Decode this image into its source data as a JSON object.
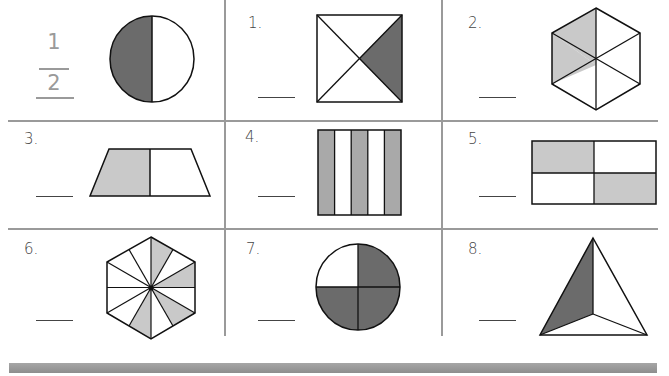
{
  "worksheet": {
    "topic": "Fractions - shaded parts of shapes",
    "example": {
      "numerator": "1",
      "denominator": "2",
      "shape": "circle",
      "parts": 2,
      "shaded": 1
    },
    "problems": [
      {
        "label": "1.",
        "shape": "square-diagonals",
        "parts": 4,
        "shaded": 1,
        "answer": ""
      },
      {
        "label": "2.",
        "shape": "hexagon",
        "parts": 6,
        "shaded": 2,
        "answer": ""
      },
      {
        "label": "3.",
        "shape": "trapezoid",
        "parts": 2,
        "shaded": 1,
        "answer": ""
      },
      {
        "label": "4.",
        "shape": "rectangle-stripes",
        "parts": 5,
        "shaded": 3,
        "answer": ""
      },
      {
        "label": "5.",
        "shape": "rectangle-grid",
        "parts": 4,
        "shaded": 2,
        "answer": ""
      },
      {
        "label": "6.",
        "shape": "hexagon-12",
        "parts": 12,
        "shaded": 4,
        "answer": ""
      },
      {
        "label": "7.",
        "shape": "circle-quarters",
        "parts": 4,
        "shaded": 3,
        "answer": ""
      },
      {
        "label": "8.",
        "shape": "triangle-thirds",
        "parts": 3,
        "shaded": 1,
        "answer": ""
      }
    ],
    "colors": {
      "dark_fill": "#6b6b6b",
      "light_fill": "#c9c9c9",
      "grid_line": "#9a9a9a",
      "example_text": "#9a9a9a"
    }
  }
}
